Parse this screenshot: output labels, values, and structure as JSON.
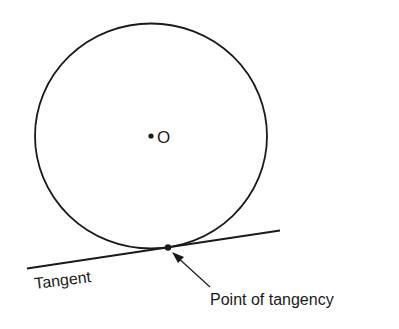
{
  "diagram": {
    "center_label": "O",
    "tangent_label": "Tangent",
    "point_label": "Point of tangency",
    "stroke_color": "#1a1a1a",
    "background": "#ffffff"
  }
}
